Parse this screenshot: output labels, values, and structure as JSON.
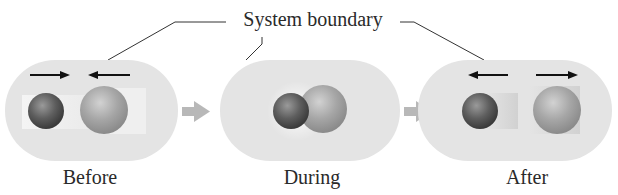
{
  "diagram": {
    "title": "System boundary",
    "stages": [
      {
        "label": "Before",
        "velocity_arrows": [
          "right",
          "left"
        ]
      },
      {
        "label": "During",
        "velocity_arrows": []
      },
      {
        "label": "After",
        "velocity_arrows": [
          "left",
          "right"
        ]
      }
    ],
    "transition_arrows": 2,
    "colors": {
      "boundary_fill": "#e4e4e4",
      "small_sphere": "#5a5a5a",
      "large_sphere": "#a8a8a8",
      "transition_arrow": "#b8b8b8",
      "velocity_arrow": "#111111",
      "leader_line": "#333333",
      "text": "#2a2a2a"
    }
  }
}
